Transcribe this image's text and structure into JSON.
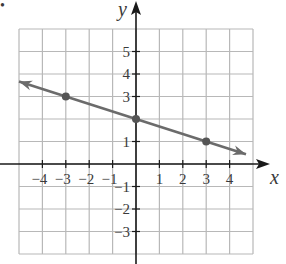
{
  "chart_data": {
    "type": "line",
    "title": "",
    "xlabel": "x",
    "ylabel": "y",
    "xlim": [
      -5,
      5
    ],
    "ylim": [
      -4,
      6
    ],
    "grid": true,
    "x_ticks": [
      -4,
      -3,
      -2,
      -1,
      1,
      2,
      3,
      4
    ],
    "x_tick_labels": [
      "−4",
      "−3",
      "−2",
      "−1",
      "1",
      "2",
      "3",
      "4"
    ],
    "y_ticks": [
      5,
      4,
      3,
      1,
      -1,
      -2,
      -3
    ],
    "y_tick_labels": [
      "5",
      "4",
      "3",
      "1",
      "−1",
      "−2",
      "−3"
    ],
    "series": [
      {
        "name": "line",
        "equation": "y = -x/3 + 2",
        "points": [
          {
            "x": -3,
            "y": 3
          },
          {
            "x": 0,
            "y": 2
          },
          {
            "x": 3,
            "y": 1
          }
        ],
        "arrow_ends": [
          {
            "x": -5,
            "y": 3.67
          },
          {
            "x": 4.7,
            "y": 0.43
          }
        ],
        "color": "#6b6b6b"
      }
    ],
    "colors": {
      "grid": "#b8b8b8",
      "axis": "#1a1a1a",
      "line": "#6b6b6b",
      "point": "#555555"
    }
  },
  "labels": {
    "x_axis": "x",
    "y_axis": "y",
    "bullet": "•"
  }
}
